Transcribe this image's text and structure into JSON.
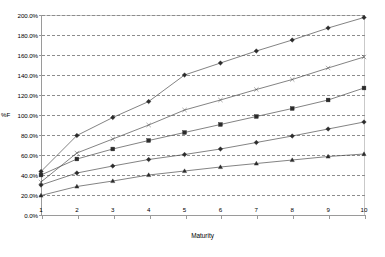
{
  "chart_data": {
    "type": "line",
    "title": "",
    "xlabel": "Maturity",
    "ylabel": "%F",
    "x": [
      1,
      2,
      3,
      4,
      5,
      6,
      7,
      8,
      9,
      10
    ],
    "xlim": [
      1,
      10
    ],
    "ylim": [
      0,
      2.0
    ],
    "grid": true,
    "legend": "none",
    "ytick_labels": [
      "0.0%",
      "20.0%",
      "40.0%",
      "60.0%",
      "80.0%",
      "100.0%",
      "120.0%",
      "140.0%",
      "160.0%",
      "180.0%",
      "200.0%"
    ],
    "ytick_values": [
      0,
      0.2,
      0.4,
      0.6,
      0.8,
      1.0,
      1.2,
      1.4,
      1.6,
      1.8,
      2.0
    ],
    "xtick_labels": [
      "1",
      "2",
      "3",
      "4",
      "5",
      "6",
      "7",
      "8",
      "9",
      "10"
    ],
    "series": [
      {
        "name": "series-1",
        "marker": "diamond",
        "values": [
          0.435,
          0.795,
          0.975,
          1.135,
          1.4,
          1.52,
          1.64,
          1.75,
          1.87,
          1.975
        ]
      },
      {
        "name": "series-2",
        "marker": "cross",
        "values": [
          0.33,
          0.62,
          0.76,
          0.9,
          1.05,
          1.15,
          1.255,
          1.355,
          1.47,
          1.58
        ]
      },
      {
        "name": "series-3",
        "marker": "square",
        "values": [
          0.4,
          0.56,
          0.66,
          0.745,
          0.825,
          0.905,
          0.985,
          1.065,
          1.15,
          1.27
        ]
      },
      {
        "name": "series-4",
        "marker": "diamond-solid",
        "values": [
          0.3,
          0.42,
          0.49,
          0.555,
          0.605,
          0.66,
          0.725,
          0.79,
          0.86,
          0.93
        ]
      },
      {
        "name": "series-5",
        "marker": "triangle",
        "values": [
          0.195,
          0.285,
          0.34,
          0.4,
          0.44,
          0.48,
          0.515,
          0.55,
          0.585,
          0.61
        ]
      }
    ]
  }
}
